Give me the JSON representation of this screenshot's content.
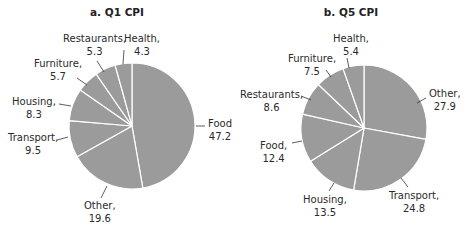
{
  "chart_data": [
    {
      "type": "pie",
      "title": "a. Q1 CPI",
      "categories": [
        "Food",
        "Other",
        "Transport",
        "Housing",
        "Furniture",
        "Restaurants",
        "Health"
      ],
      "values": [
        47.2,
        19.6,
        9.5,
        8.3,
        5.7,
        5.3,
        4.3
      ],
      "start_angle_deg": 0,
      "direction": "clockwise",
      "slice_color": "#9b9b9b",
      "separator_color": "#ffffff"
    },
    {
      "type": "pie",
      "title": "b. Q5 CPI",
      "categories": [
        "Other",
        "Transport",
        "Housing",
        "Food",
        "Restaurants",
        "Furniture",
        "Health"
      ],
      "values": [
        27.9,
        24.8,
        13.5,
        12.4,
        8.6,
        7.5,
        5.4
      ],
      "start_angle_deg": 0,
      "direction": "clockwise",
      "slice_color": "#9b9b9b",
      "separator_color": "#ffffff"
    }
  ],
  "panels": {
    "a": {
      "title": "a. Q1 CPI",
      "labels": {
        "food": {
          "name": "Food",
          "value": "47.2"
        },
        "other": {
          "name": "Other,",
          "value": "19.6"
        },
        "transport": {
          "name": "Transport,",
          "value": "9.5"
        },
        "housing": {
          "name": "Housing,",
          "value": "8.3"
        },
        "furniture": {
          "name": "Furniture,",
          "value": "5.7"
        },
        "restaurants": {
          "name": "Restaurants,",
          "value": "5.3"
        },
        "health": {
          "name": "Health,",
          "value": "4.3"
        }
      }
    },
    "b": {
      "title": "b. Q5 CPI",
      "labels": {
        "other": {
          "name": "Other,",
          "value": "27.9"
        },
        "transport": {
          "name": "Transport,",
          "value": "24.8"
        },
        "housing": {
          "name": "Housing,",
          "value": "13.5"
        },
        "food": {
          "name": "Food,",
          "value": "12.4"
        },
        "restaurants": {
          "name": "Restaurants,",
          "value": "8.6"
        },
        "furniture": {
          "name": "Furniture,",
          "value": "7.5"
        },
        "health": {
          "name": "Health,",
          "value": "5.4"
        }
      }
    }
  }
}
